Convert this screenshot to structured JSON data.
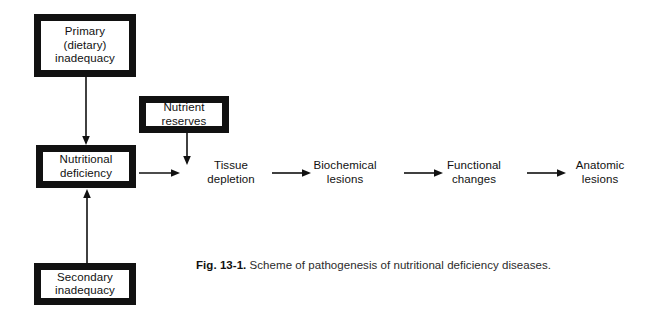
{
  "figure": {
    "caption_label": "Fig. 13-1.",
    "caption_text": " Scheme of pathogenesis of nutritional deficiency diseases."
  },
  "diagram": {
    "type": "flowchart",
    "background_color": "#ffffff",
    "stroke_color": "#111111",
    "boxed_nodes": [
      {
        "id": "primary",
        "label": "Primary\n(dietary)\ninadequacy",
        "x": 34,
        "y": 14,
        "width": 102,
        "height": 63
      },
      {
        "id": "nutrient-reserves",
        "label": "Nutrient\nreserves",
        "x": 139,
        "y": 96,
        "width": 90,
        "height": 37
      },
      {
        "id": "nutritional-deficiency",
        "label": "Nutritional\ndeficiency",
        "x": 36,
        "y": 145,
        "width": 100,
        "height": 43
      },
      {
        "id": "secondary",
        "label": "Secondary\ninadequacy",
        "x": 34,
        "y": 263,
        "width": 102,
        "height": 42
      }
    ],
    "chain_nodes": [
      {
        "id": "tissue-depletion",
        "label": "Tissue\ndepletion",
        "cx": 231,
        "cy": 172
      },
      {
        "id": "biochemical-lesions",
        "label": "Biochemical\nlesions",
        "cx": 345,
        "cy": 172
      },
      {
        "id": "functional-changes",
        "label": "Functional\nchanges",
        "cx": 474,
        "cy": 172
      },
      {
        "id": "anatomic-lesions",
        "label": "Anatomic\nlesions",
        "cx": 600,
        "cy": 172
      }
    ],
    "arrows": [
      {
        "id": "primary-to-deficiency",
        "from": "primary",
        "to": "nutritional-deficiency",
        "direction": "down"
      },
      {
        "id": "secondary-to-deficiency",
        "from": "secondary",
        "to": "nutritional-deficiency",
        "direction": "up"
      },
      {
        "id": "reserves-to-tissue",
        "from": "nutrient-reserves",
        "to": "tissue-depletion",
        "direction": "down"
      },
      {
        "id": "deficiency-to-tissue",
        "from": "nutritional-deficiency",
        "to": "tissue-depletion",
        "direction": "right"
      },
      {
        "id": "tissue-to-biochemical",
        "from": "tissue-depletion",
        "to": "biochemical-lesions",
        "direction": "right"
      },
      {
        "id": "biochemical-to-functional",
        "from": "biochemical-lesions",
        "to": "functional-changes",
        "direction": "right"
      },
      {
        "id": "functional-to-anatomic",
        "from": "functional-changes",
        "to": "anatomic-lesions",
        "direction": "right"
      }
    ]
  }
}
